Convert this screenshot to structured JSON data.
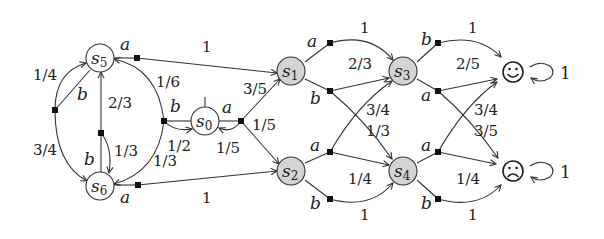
{
  "diagram": {
    "type": "markov-decision-process",
    "states": [
      {
        "id": "s0",
        "label": "s",
        "sub": "0",
        "shaded": false,
        "initial": true
      },
      {
        "id": "s1",
        "label": "s",
        "sub": "1",
        "shaded": true
      },
      {
        "id": "s2",
        "label": "s",
        "sub": "2",
        "shaded": true
      },
      {
        "id": "s3",
        "label": "s",
        "sub": "3",
        "shaded": true
      },
      {
        "id": "s4",
        "label": "s",
        "sub": "4",
        "shaded": true
      },
      {
        "id": "s5",
        "label": "s",
        "sub": "5",
        "shaded": false
      },
      {
        "id": "s6",
        "label": "s",
        "sub": "6",
        "shaded": false
      },
      {
        "id": "happy",
        "label": "☺",
        "terminal": true
      },
      {
        "id": "sad",
        "label": "☹",
        "terminal": true
      }
    ],
    "actions": {
      "a": "a",
      "b": "b"
    },
    "labels": {
      "s0_a_s1": "3/5",
      "s0_a_s2": "1/5",
      "s0_a_s0": "1/5",
      "s0_b_s5": "1/6",
      "s0_b_s6": "1/3",
      "s0_b_s0": "1/2",
      "s5_a_s1": "1",
      "s5_b_s5": "1/4",
      "s5_b_s6": "3/4",
      "s6_a_s2": "1",
      "s6_b_s5": "2/3",
      "s6_b_s6": "1/3",
      "s1_a_s3": "1",
      "s1_b_s3": "2/3",
      "s1_b_s4": "1/3",
      "s2_a_s3": "3/4",
      "s2_a_s4": "1/4",
      "s2_b_s4": "1",
      "s3_b_happy": "1",
      "s3_a_happy": "2/5",
      "s3_a_sad": "3/5",
      "s4_a_happy": "3/4",
      "s4_a_sad": "1/4",
      "s4_b_sad": "1",
      "happy_loop": "1",
      "sad_loop": "1"
    }
  }
}
